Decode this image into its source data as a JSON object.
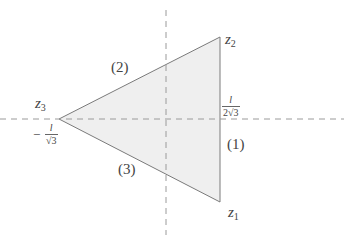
{
  "diagram": {
    "type": "triangle-in-complex-plane",
    "colors": {
      "fill": "#efefef",
      "stroke": "#7a7a7a",
      "axis": "#9a9a9a",
      "text": "#444444"
    },
    "vertices": {
      "z1": {
        "label_var": "z",
        "label_sub": "1"
      },
      "z2": {
        "label_var": "z",
        "label_sub": "2"
      },
      "z3": {
        "label_var": "z",
        "label_sub": "3"
      }
    },
    "sides": {
      "s1": "(1)",
      "s2": "(2)",
      "s3": "(3)"
    },
    "ticks": {
      "right": {
        "numerator": "l",
        "denominator": "2√3"
      },
      "left": {
        "sign": "−",
        "numerator": "l",
        "denominator": "√3"
      }
    }
  }
}
